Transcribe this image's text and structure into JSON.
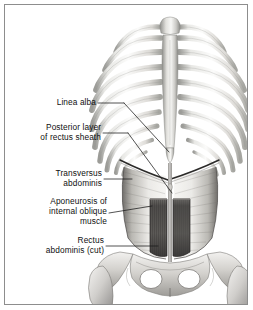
{
  "figure": {
    "border_color": "#8d8d8d",
    "background_color": "#ffffff",
    "ink_color": "#101010"
  },
  "labels": [
    {
      "id": "linea-alba",
      "text": "Linea alba"
    },
    {
      "id": "posterior-layer",
      "text": "Posterior layer\nof rectus sheath"
    },
    {
      "id": "transversus",
      "text": "Transversus\nabdominis"
    },
    {
      "id": "aponeurosis",
      "text": "Aponeurosis of\ninternal oblique\nmuscle"
    },
    {
      "id": "rectus",
      "text": "Rectus\nabdominis (cut)"
    }
  ],
  "anatomy": {
    "parts": [
      "rib-cage",
      "sternum",
      "costal-margin",
      "transversus-abdominis",
      "rectus-abdominis-cut",
      "linea-alba",
      "pelvis",
      "femur-head-left",
      "femur-head-right"
    ]
  },
  "palette": {
    "bone_light": "#f2f2f0",
    "bone_mid": "#cfcfcb",
    "bone_shadow": "#9a9a96",
    "muscle_light": "#d8d6d2",
    "muscle_mid": "#9b9893",
    "muscle_dark": "#585654",
    "muscle_darkest": "#3f3d3c",
    "outline": "#2a2a2a"
  }
}
